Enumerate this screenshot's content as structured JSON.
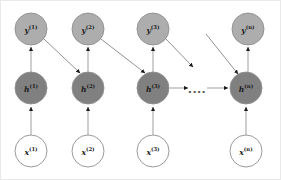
{
  "figure": {
    "background_color": "#ffffff",
    "border_color": "#e9e9e9",
    "width": 281,
    "height": 180
  },
  "style": {
    "output_node_fill": "#adadad",
    "hidden_node_fill": "#808080",
    "input_node_fill": "#ffffff",
    "node_stroke": "#8f8f8f",
    "edge_color": "#9a9a9a",
    "arrowhead_color": "#1a1a1a",
    "label_color": "#1a1a1a",
    "node_radius": 16
  },
  "layers": {
    "output": {
      "name": "output-layer",
      "symbol": "y",
      "fill": "#adadad",
      "cy": 28,
      "nodes": [
        {
          "id": "y1",
          "base": "y",
          "sup": "(1)",
          "label": "y(1)",
          "cx": 30
        },
        {
          "id": "y2",
          "base": "y",
          "sup": "(2)",
          "label": "y(2)",
          "cx": 87
        },
        {
          "id": "y3",
          "base": "y",
          "sup": "(3)",
          "label": "y(3)",
          "cx": 152
        },
        {
          "id": "yn",
          "base": "y",
          "sup": "(n)",
          "label": "y(n)",
          "cx": 247
        }
      ]
    },
    "hidden": {
      "name": "hidden-layer",
      "symbol": "h",
      "fill": "#808080",
      "cy": 87,
      "nodes": [
        {
          "id": "h1",
          "base": "h",
          "sup": "(1)",
          "label": "h(1)",
          "cx": 30
        },
        {
          "id": "h2",
          "base": "h",
          "sup": "(2)",
          "label": "h(2)",
          "cx": 87
        },
        {
          "id": "h3",
          "base": "h",
          "sup": "(3)",
          "label": "h(3)",
          "cx": 152
        },
        {
          "id": "hn",
          "base": "h",
          "sup": "(n)",
          "label": "h(n)",
          "cx": 245
        }
      ]
    },
    "input": {
      "name": "input-layer",
      "symbol": "x",
      "fill": "#ffffff",
      "cy": 150,
      "nodes": [
        {
          "id": "x1",
          "base": "x",
          "sup": "(1)",
          "label": "x(1)",
          "cx": 30
        },
        {
          "id": "x2",
          "base": "x",
          "sup": "(2)",
          "label": "x(2)",
          "cx": 87
        },
        {
          "id": "x3",
          "base": "x",
          "sup": "(3)",
          "label": "x(3)",
          "cx": 152
        },
        {
          "id": "xn",
          "base": "x",
          "sup": "(n)",
          "label": "x(n)",
          "cx": 245
        }
      ]
    }
  },
  "edges": {
    "input_to_hidden": [
      {
        "name": "edge-x1-h1",
        "from": "x1",
        "to": "h1"
      },
      {
        "name": "edge-x2-h2",
        "from": "x2",
        "to": "h2"
      },
      {
        "name": "edge-x3-h3",
        "from": "x3",
        "to": "h3"
      },
      {
        "name": "edge-xn-hn",
        "from": "xn",
        "to": "hn"
      }
    ],
    "hidden_to_output": [
      {
        "name": "edge-h1-y1",
        "from": "h1",
        "to": "y1"
      },
      {
        "name": "edge-h2-y2",
        "from": "h2",
        "to": "y2"
      },
      {
        "name": "edge-h3-y3",
        "from": "h3",
        "to": "y3"
      },
      {
        "name": "edge-hn-yn",
        "from": "hn",
        "to": "yn"
      }
    ],
    "output_feedback": [
      {
        "name": "edge-y1-h2",
        "from": "y1",
        "to": "h2"
      },
      {
        "name": "edge-y2-h3",
        "from": "y2",
        "to": "h3"
      },
      {
        "name": "edge-y3-dangling",
        "from": "y3",
        "to": "skipped-step"
      },
      {
        "name": "edge-dangling-hn",
        "from": "skipped-step",
        "to": "hn"
      }
    ],
    "recurrent": [
      {
        "name": "edge-h3-ellipsis",
        "from": "h3",
        "to": "ellipsis"
      },
      {
        "name": "edge-ellipsis-hn",
        "from": "ellipsis",
        "to": "hn"
      }
    ]
  },
  "ellipsis": {
    "name": "sequence-ellipsis",
    "text": "....",
    "cx": 196,
    "cy": 87
  }
}
